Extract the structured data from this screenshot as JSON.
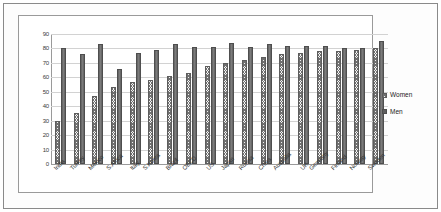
{
  "chart_data": {
    "type": "bar",
    "title": "",
    "subtitle": "",
    "xlabel": "",
    "ylabel": "",
    "ylim": [
      0,
      90
    ],
    "ytick_step": 10,
    "yticks": [
      0,
      10,
      20,
      30,
      40,
      50,
      60,
      70,
      80,
      90
    ],
    "grid": true,
    "legend_position": "right",
    "categories": [
      "India",
      "Turkey",
      "Mexico",
      "S.Africa",
      "Italy",
      "S.Korea",
      "Brazil",
      "OECD",
      "US",
      "Japan",
      "Russia",
      "China",
      "Australia",
      "UK",
      "Germany",
      "Finland",
      "Norway",
      "Sweden"
    ],
    "series": [
      {
        "name": "Women",
        "color": "#6f6f6f",
        "pattern": "checkered-hatch",
        "values": [
          30,
          35,
          47,
          53,
          57,
          58,
          61,
          63,
          68,
          70,
          72,
          74,
          76,
          77,
          78,
          78,
          79,
          80
        ]
      },
      {
        "name": "Men",
        "color": "#5f5f5f",
        "pattern": "solid",
        "values": [
          80,
          76,
          83,
          66,
          77,
          79,
          83,
          81,
          81,
          84,
          81,
          83,
          82,
          82,
          82,
          80,
          80,
          85
        ]
      }
    ],
    "legend": [
      "Women",
      "Men"
    ]
  },
  "legend": {
    "women_label": "Women",
    "men_label": "Men"
  }
}
